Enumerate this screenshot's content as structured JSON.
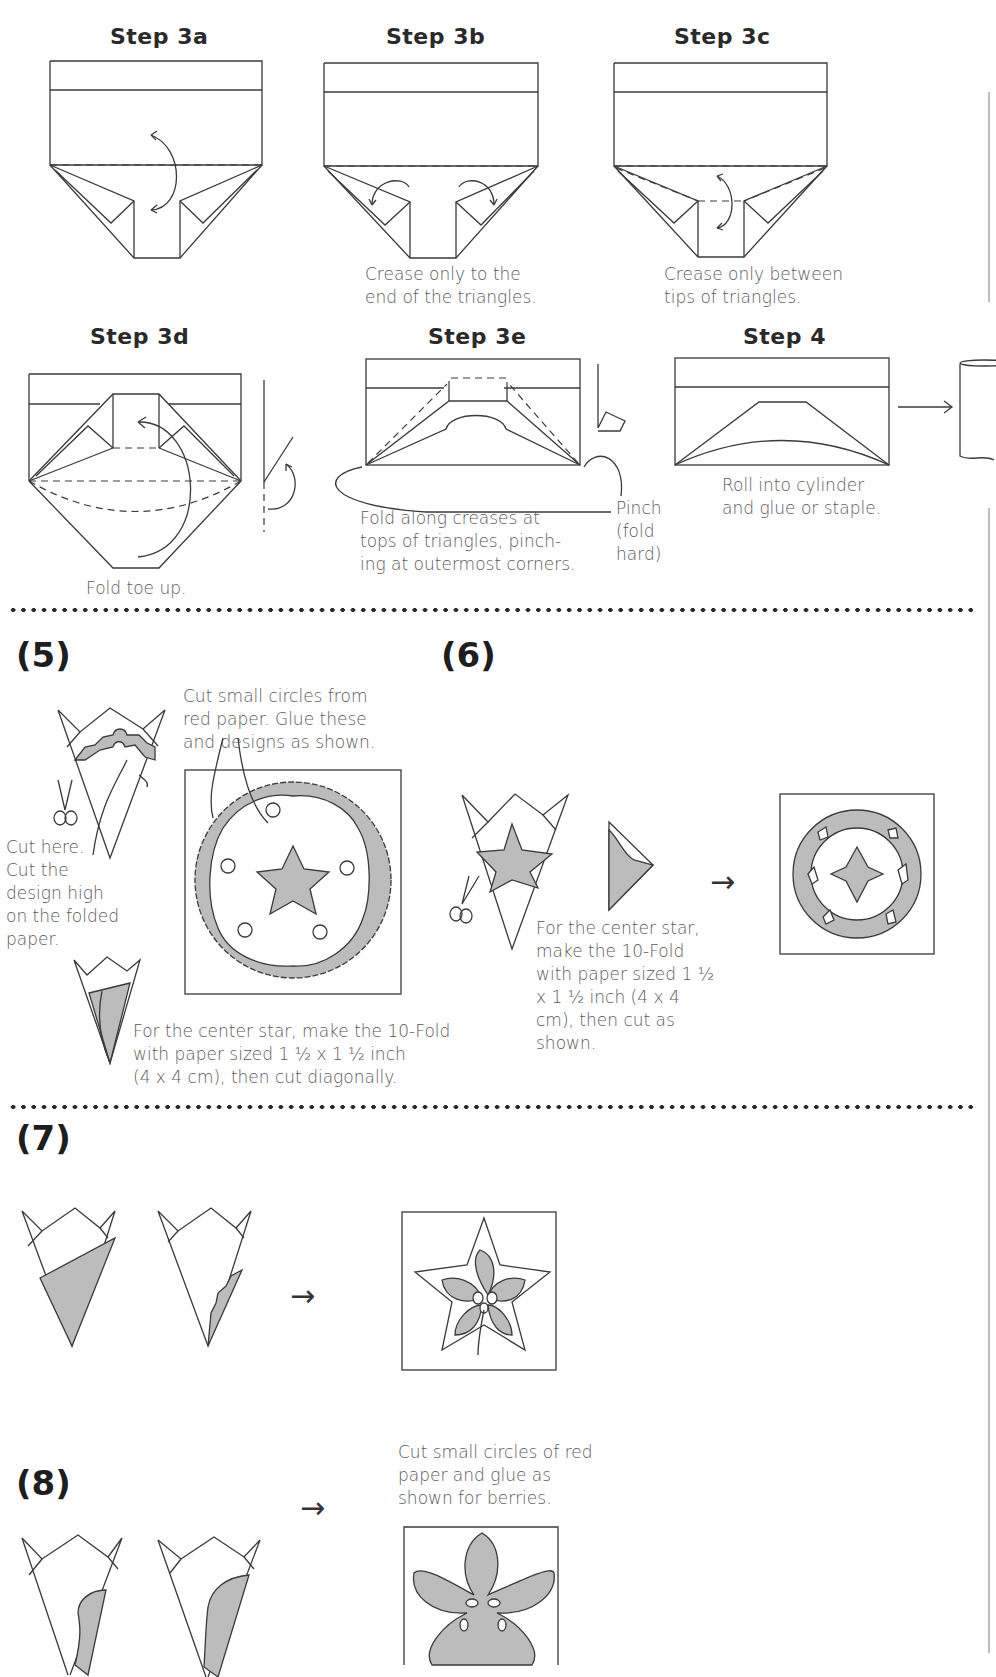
{
  "steps": {
    "s3a": {
      "title": "Step 3a",
      "caption": ""
    },
    "s3b": {
      "title": "Step 3b",
      "caption": "Crease only to the\nend of the triangles."
    },
    "s3c": {
      "title": "Step 3c",
      "caption": "Crease only between\ntips of triangles."
    },
    "s3d": {
      "title": "Step 3d",
      "caption": "Fold toe up."
    },
    "s3e": {
      "title": "Step 3e",
      "caption": "Fold along creases at\ntops of triangles, pinch-\ning at outermost corners.",
      "pinch_label": "Pinch\n(fold\nhard)"
    },
    "s4": {
      "title": "Step 4",
      "caption": "Roll into cylinder\nand glue or staple."
    }
  },
  "sections": {
    "sec5": {
      "number": "(5)",
      "note_circles": "Cut small circles from\nred paper. Glue these\nand designs as shown.",
      "note_cut": "Cut here.\nCut the\ndesign high\non the folded\npaper.",
      "note_star": "For the center star, make the 10-Fold\nwith paper sized 1 ½ x 1 ½ inch\n(4 x 4 cm), then cut diagonally."
    },
    "sec6": {
      "number": "(6)",
      "note_star": "For the center star,\nmake the 10-Fold\nwith paper sized 1 ½\nx 1 ½ inch (4 x 4\ncm), then cut as\nshown."
    },
    "sec7": {
      "number": "(7)"
    },
    "sec8": {
      "number": "(8)",
      "note_berries": "Cut small circles of red\npaper and glue as\nshown for berries."
    }
  },
  "icons": {
    "arrow": "→",
    "scissors": "scissors-icon"
  },
  "colors": {
    "line": "#3a3a3a",
    "shade": "#bcbcbc",
    "text": "#5a5a5a",
    "heading": "#2a2a2a"
  }
}
